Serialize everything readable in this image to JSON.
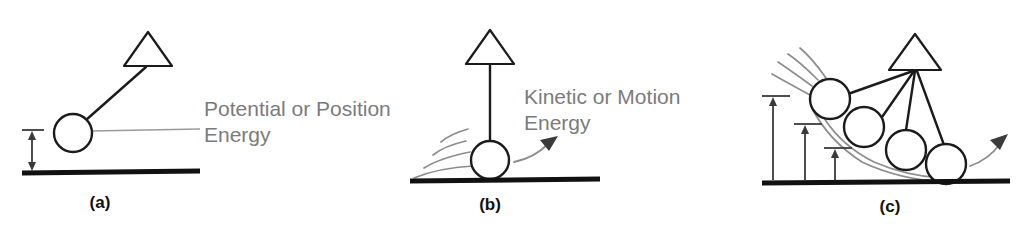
{
  "figure": {
    "background_color": "#ffffff",
    "ink_color": "#1b1b1b",
    "annotation_color": "#7b7b7b",
    "trail_color": "#8d8d8d"
  },
  "panels": [
    {
      "id": "a",
      "caption": "(a)",
      "caption_x": 100,
      "caption_y": 208,
      "annotation_line1": "Potential or Position",
      "annotation_line2": "Energy",
      "annotation_x": 204,
      "annotation_y1": 116,
      "annotation_y2": 142,
      "ground": {
        "x1": 22,
        "x2": 200,
        "y": 173
      },
      "pivot": {
        "x": 148,
        "y": 66,
        "apex_y": 32,
        "half_width": 24
      },
      "bob": {
        "cx": 73,
        "cy": 133,
        "r": 19
      },
      "height_arrow": {
        "x": 32,
        "y_top": 130,
        "y_bottom": 171,
        "tick_half": 10
      },
      "leader": {
        "x1": 92,
        "y1": 131,
        "x2": 200,
        "y2": 129
      }
    },
    {
      "id": "b",
      "caption": "(b)",
      "caption_x": 490,
      "caption_y": 210,
      "annotation_line1": "Kinetic or Motion",
      "annotation_line2": "Energy",
      "annotation_x": 524,
      "annotation_y1": 104,
      "annotation_y2": 130,
      "ground": {
        "x1": 410,
        "x2": 600,
        "y": 180
      },
      "pivot": {
        "x": 490,
        "y": 64,
        "apex_y": 30,
        "half_width": 24
      },
      "bob": {
        "cx": 490,
        "cy": 160,
        "r": 19
      },
      "motion_arrow": {
        "x1": 516,
        "y1": 160,
        "x2": 556,
        "y2": 138
      }
    },
    {
      "id": "c",
      "caption": "(c)",
      "caption_x": 890,
      "caption_y": 212,
      "ground": {
        "x1": 762,
        "x2": 1010,
        "y": 182
      },
      "pivot": {
        "x": 915,
        "y": 70,
        "apex_y": 34,
        "half_width": 26
      },
      "bobs": [
        {
          "cx": 830,
          "cy": 99,
          "r": 20
        },
        {
          "cx": 864,
          "cy": 127,
          "r": 20
        },
        {
          "cx": 906,
          "cy": 150,
          "r": 20
        },
        {
          "cx": 946,
          "cy": 164,
          "r": 20
        }
      ],
      "height_arrows": [
        {
          "x": 773,
          "y_top": 96,
          "y_bottom": 180,
          "tick_x2": 789
        },
        {
          "x": 805,
          "y_top": 124,
          "y_bottom": 180,
          "tick_x2": 821
        },
        {
          "x": 835,
          "y_top": 148,
          "y_bottom": 180,
          "tick_x2": 851
        }
      ],
      "motion_arrow": {
        "x1": 972,
        "y1": 163,
        "x2": 1004,
        "y2": 137
      }
    }
  ]
}
